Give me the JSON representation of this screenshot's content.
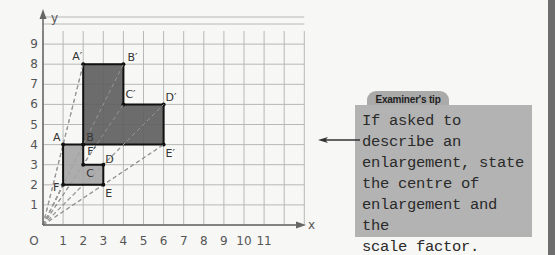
{
  "graph": {
    "x_axis_label": "x",
    "y_axis_label": "y",
    "origin_label": "O",
    "x_ticks": [
      "1",
      "2",
      "3",
      "4",
      "5",
      "6",
      "7",
      "8",
      "9",
      "10",
      "11"
    ],
    "y_ticks": [
      "1",
      "2",
      "3",
      "4",
      "5",
      "6",
      "7",
      "8",
      "9"
    ],
    "x_range": [
      0,
      11.5
    ],
    "y_range": [
      0,
      9.5
    ],
    "centre_of_enlargement": [
      0,
      0
    ],
    "scale_factor": 2,
    "object_shape": {
      "name": "ABCDEF",
      "fill": "#a6a6a6",
      "vertices": [
        {
          "label": "A",
          "x": 1,
          "y": 4
        },
        {
          "label": "B",
          "x": 2,
          "y": 4
        },
        {
          "label": "C",
          "x": 2,
          "y": 3
        },
        {
          "label": "D",
          "x": 3,
          "y": 3
        },
        {
          "label": "E",
          "x": 3,
          "y": 2
        },
        {
          "label": "F",
          "x": 1,
          "y": 2
        }
      ]
    },
    "image_shape": {
      "name": "A'B'C'D'E'F'",
      "fill": "#5f5f5f",
      "vertices": [
        {
          "label": "A′",
          "x": 2,
          "y": 8
        },
        {
          "label": "B′",
          "x": 4,
          "y": 8
        },
        {
          "label": "C′",
          "x": 4,
          "y": 6
        },
        {
          "label": "D′",
          "x": 6,
          "y": 6
        },
        {
          "label": "E′",
          "x": 6,
          "y": 4
        },
        {
          "label": "F′",
          "x": 2,
          "y": 4
        }
      ]
    }
  },
  "tip": {
    "title": "Examiner's tip",
    "text": "If asked to\ndescribe an\nenlargement, state\nthe centre of\nenlargement and the\nscale factor."
  },
  "icons": {
    "pointer": "left-arrow-icon"
  }
}
